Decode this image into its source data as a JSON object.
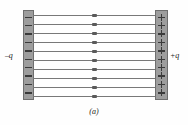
{
  "figure": {
    "caption": "(a)",
    "left_plate": {
      "label": "–q",
      "charge_sign": "minus",
      "charge_symbol": "–",
      "charge_count": 10,
      "color": "#9d9d9d"
    },
    "right_plate": {
      "label": "+q",
      "charge_sign": "plus",
      "charge_symbol": "+",
      "charge_count": 10,
      "color": "#9d9d9d"
    },
    "field": {
      "line_count": 10,
      "line_color": "#787878",
      "arrow_direction": "right",
      "arrow_position": "midpoint"
    }
  }
}
